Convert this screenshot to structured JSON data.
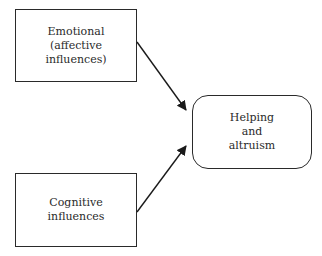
{
  "diagram": {
    "nodes": [
      {
        "id": "emotional",
        "lines": [
          "Emotional",
          "(affective",
          "influences)"
        ],
        "shape": "rectangle"
      },
      {
        "id": "cognitive",
        "lines": [
          "Cognitive",
          "influences"
        ],
        "shape": "rectangle"
      },
      {
        "id": "outcome",
        "lines": [
          "Helping",
          "and",
          "altruism"
        ],
        "shape": "rounded-rectangle"
      }
    ],
    "edges": [
      {
        "from": "emotional",
        "to": "outcome"
      },
      {
        "from": "cognitive",
        "to": "outcome"
      }
    ],
    "colors": {
      "stroke": "#2a2a2a",
      "background": "#ffffff"
    }
  }
}
